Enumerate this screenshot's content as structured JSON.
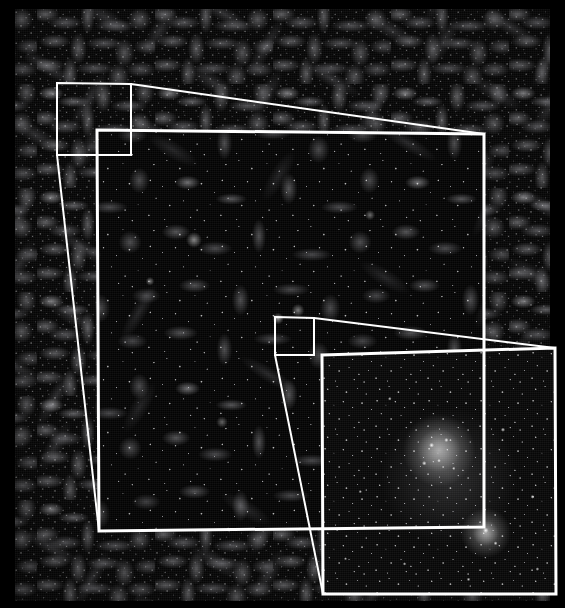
{
  "figure": {
    "background_color": "#000000",
    "outline_color": "#ffffff",
    "canvas": {
      "width": 565,
      "height": 608
    }
  },
  "panels": [
    {
      "id": "level-0",
      "name": "full-box-panel",
      "role": "Large-scale structure: full simulation volume showing the cosmic web of filaments, sheets and voids",
      "zoom_level": 0,
      "rect": {
        "x": 15,
        "y": 9,
        "width": 535,
        "height": 592
      },
      "appearance": "dense grey filamentary web on near-black background"
    },
    {
      "id": "level-1",
      "name": "intermediate-zoom-panel",
      "role": "First zoom: re-simulated sub-volume resolving individual haloes along filaments",
      "zoom_level": 1,
      "corners": [
        [
          97,
          130
        ],
        [
          484,
          134
        ],
        [
          484,
          527
        ],
        [
          99,
          531
        ]
      ],
      "appearance": "darker background with bright point-like haloes strung along filaments"
    },
    {
      "id": "level-2",
      "name": "halo-zoom-panel",
      "role": "Second zoom: single dark-matter halo with resolved subhaloes and a merging companion",
      "zoom_level": 2,
      "corners": [
        [
          322,
          355
        ],
        [
          555,
          348
        ],
        [
          556,
          594
        ],
        [
          323,
          594
        ]
      ],
      "appearance": "extended diffuse halo glow with hundreds of bright subhalo points"
    }
  ],
  "selection_boxes": [
    {
      "id": "selection-level-1",
      "name": "selection-box-level-1",
      "label": "Region selected for first zoom",
      "corners": [
        [
          57,
          83
        ],
        [
          131,
          84
        ],
        [
          131,
          155
        ],
        [
          57,
          155
        ]
      ],
      "parent_panel": "level-0",
      "child_panel": "level-1"
    },
    {
      "id": "selection-level-2",
      "name": "selection-box-level-2",
      "label": "Region selected for second zoom",
      "corners": [
        [
          275,
          317
        ],
        [
          314,
          318
        ],
        [
          314,
          355
        ],
        [
          275,
          355
        ]
      ],
      "parent_panel": "level-1",
      "child_panel": "level-2"
    }
  ],
  "connector_lines": [
    {
      "id": "connector-1-top",
      "name": "zoom-connector-line-1-top",
      "from": [
        131,
        84
      ],
      "to": [
        484,
        134
      ],
      "description": "Leader line from top-right of level-1 selection box to top-right of intermediate zoom panel"
    },
    {
      "id": "connector-1-bottom",
      "name": "zoom-connector-line-1-bottom",
      "from": [
        57,
        155
      ],
      "to": [
        99,
        531
      ],
      "description": "Leader line from bottom-left of level-1 selection box to bottom-left of intermediate zoom panel"
    },
    {
      "id": "connector-2-top",
      "name": "zoom-connector-line-2-top",
      "from": [
        314,
        318
      ],
      "to": [
        555,
        348
      ],
      "description": "Leader line from top-right of level-2 selection box to top-right of halo zoom panel"
    },
    {
      "id": "connector-2-bottom",
      "name": "zoom-connector-line-2-bottom",
      "from": [
        275,
        355
      ],
      "to": [
        323,
        594
      ],
      "description": "Leader line from bottom-left of level-2 selection box to bottom-left of halo zoom panel"
    }
  ],
  "style": {
    "stroke_width_panel": 3,
    "stroke_width_selection": 2,
    "stroke_width_connector": 2
  }
}
